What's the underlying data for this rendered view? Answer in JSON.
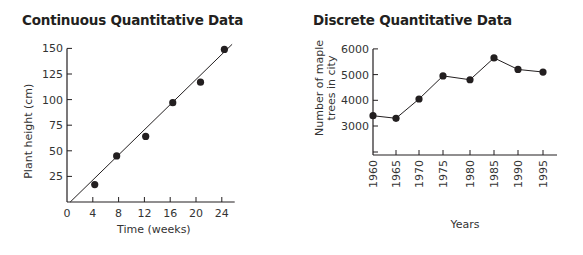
{
  "chart_data": [
    {
      "type": "scatter",
      "title": "Continuous Quantitative Data",
      "xlabel": "Time (weeks)",
      "ylabel": "Plant height (cm)",
      "xticks": [
        0,
        4,
        8,
        12,
        16,
        20,
        24
      ],
      "yticks": [
        25,
        50,
        75,
        100,
        125,
        150
      ],
      "xlim": [
        0,
        26
      ],
      "ylim": [
        0,
        150
      ],
      "grid": false,
      "legend": null,
      "points": [
        {
          "x": 4.3,
          "y": 17
        },
        {
          "x": 7.7,
          "y": 45
        },
        {
          "x": 12.2,
          "y": 64
        },
        {
          "x": 16.4,
          "y": 97
        },
        {
          "x": 20.7,
          "y": 117
        },
        {
          "x": 24.4,
          "y": 149
        }
      ],
      "trendline": {
        "from": {
          "x": 0.5,
          "y": 0
        },
        "to": {
          "x": 25.6,
          "y": 154
        }
      }
    },
    {
      "type": "line",
      "title": "Discrete Quantitative Data",
      "xlabel": "Years",
      "ylabel": "Number of maple trees in city",
      "ylabel_lines": [
        "Number of maple",
        "trees in city"
      ],
      "categories": [
        "1960",
        "1965",
        "1970",
        "1975",
        "1980",
        "1985",
        "1990",
        "1995"
      ],
      "yticks": [
        3000,
        4000,
        5000,
        6000
      ],
      "ylim": [
        2000,
        6000
      ],
      "axis_break": true,
      "grid": false,
      "legend": null,
      "series": [
        {
          "name": "Maple trees",
          "values": [
            3400,
            3300,
            4050,
            4950,
            4800,
            5650,
            5200,
            5100
          ]
        }
      ]
    }
  ]
}
